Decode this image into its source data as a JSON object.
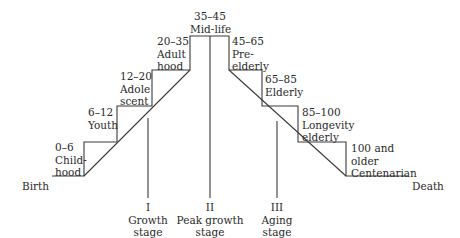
{
  "diagram": {
    "endpoints": {
      "start": "Birth",
      "end": "Death"
    },
    "life_stages": [
      {
        "range": "0–6",
        "name_line1": "Child-",
        "name_line2": "hood"
      },
      {
        "range": "6–12",
        "name_line1": "Youth",
        "name_line2": ""
      },
      {
        "range": "12–20",
        "name_line1": "Adole",
        "name_line2": "scent"
      },
      {
        "range": "20–35",
        "name_line1": "Adult",
        "name_line2": "hood"
      },
      {
        "range": "35–45",
        "name_line1": "Mid-life",
        "name_line2": ""
      },
      {
        "range": "45–65",
        "name_line1": "Pre-",
        "name_line2": "elderly"
      },
      {
        "range": "65–85",
        "name_line1": "Elderly",
        "name_line2": ""
      },
      {
        "range": "85–100",
        "name_line1": "Longevity",
        "name_line2": "elderly"
      },
      {
        "range": "100 and",
        "name_line1": "older",
        "name_line2": "Centenarian"
      }
    ],
    "phases": [
      {
        "numeral": "I",
        "line1": "Growth",
        "line2": "stage"
      },
      {
        "numeral": "II",
        "line1": "Peak growth",
        "line2": "stage"
      },
      {
        "numeral": "III",
        "line1": "Aging",
        "line2": "stage"
      }
    ],
    "line_color": "#3a3a3a"
  }
}
